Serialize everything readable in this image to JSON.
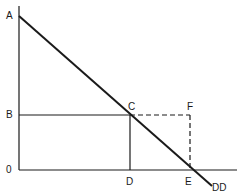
{
  "diagram": {
    "type": "supply-demand-rectangle",
    "labels": {
      "A": "A",
      "B": "B",
      "origin": "0",
      "C": "C",
      "F": "F",
      "D": "D",
      "E": "E",
      "demand": "DD"
    },
    "points": {
      "A": [
        19,
        16
      ],
      "B": [
        19,
        115
      ],
      "O": [
        19,
        170
      ],
      "C": [
        130,
        115
      ],
      "F": [
        190,
        115
      ],
      "D": [
        130,
        170
      ],
      "E": [
        189,
        170
      ],
      "DD_end": [
        212,
        186
      ]
    },
    "colors": {
      "line": "#1a1a1a",
      "background": "#ffffff"
    }
  }
}
